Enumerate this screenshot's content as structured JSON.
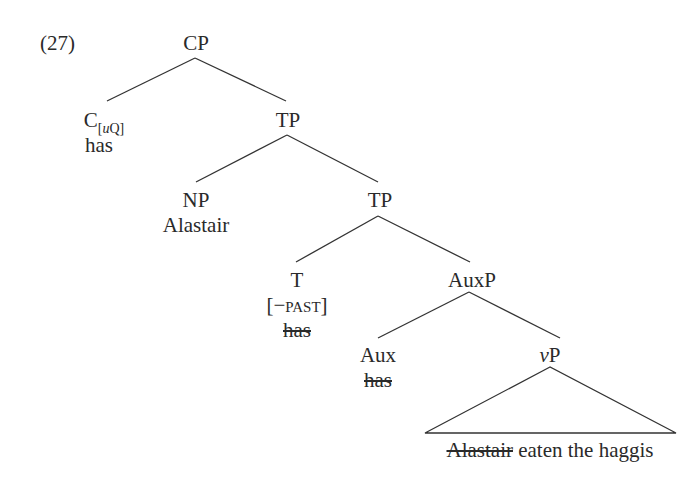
{
  "example_number": "(27)",
  "tree": {
    "cp": {
      "label": "CP"
    },
    "c": {
      "label": "C",
      "feature_open": "[",
      "feature_u": "u",
      "feature_q": "Q]",
      "word": "has"
    },
    "tp1": {
      "label": "TP"
    },
    "np": {
      "label": "NP",
      "word": "Alastair"
    },
    "tp2": {
      "label": "TP"
    },
    "t": {
      "label": "T",
      "feature": "[−past]",
      "word_struck": "has"
    },
    "auxp": {
      "label": "AuxP"
    },
    "aux": {
      "label": "Aux",
      "word_struck": "has"
    },
    "vp": {
      "label_italic": "v",
      "label_rest": "P",
      "yield_struck": "Alastair",
      "yield_rest": " eaten the haggis"
    }
  },
  "colors": {
    "ink": "#2a2a2a",
    "background": "#ffffff"
  }
}
